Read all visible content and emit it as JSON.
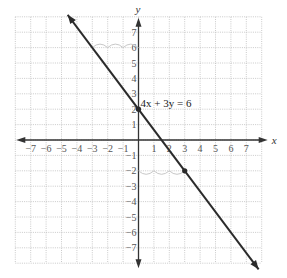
{
  "chart_data": {
    "type": "line",
    "title": "",
    "equation_label": "4x + 3y = 6",
    "xlabel": "x",
    "ylabel": "y",
    "xlim": [
      -8,
      8
    ],
    "ylim": [
      -8,
      8
    ],
    "grid": true,
    "x_ticks": [
      -7,
      -6,
      -5,
      -4,
      -3,
      -2,
      -1,
      1,
      2,
      3,
      4,
      5,
      6,
      7
    ],
    "y_ticks": [
      -7,
      -6,
      -5,
      -4,
      -3,
      -2,
      -1,
      1,
      2,
      3,
      4,
      5,
      6,
      7
    ],
    "series": [
      {
        "name": "4x + 3y = 6",
        "slope": -1.3333,
        "intercept": 2,
        "x": [
          -4.6,
          7.8
        ],
        "y": [
          8.13,
          -8.4
        ]
      }
    ],
    "points": [
      {
        "x": 0,
        "y": 2
      },
      {
        "x": 3,
        "y": -2
      }
    ],
    "annotations": [
      {
        "type": "arcs",
        "desc": "three arcs along y=6 from x=-3 to x=0 (run of 3)"
      },
      {
        "type": "arcs",
        "desc": "three arcs along y=-2 from x=0 to x=3 (run of 3)"
      }
    ]
  }
}
